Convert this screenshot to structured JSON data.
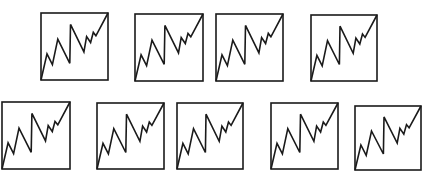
{
  "figure": {
    "stroke_color": "#1a1a1a",
    "background_color": "#ffffff",
    "stroke_width": 1.6,
    "zigzag_points_normalized": [
      [
        0,
        100
      ],
      [
        9,
        61
      ],
      [
        17,
        77
      ],
      [
        25,
        39
      ],
      [
        43,
        75
      ],
      [
        44,
        17
      ],
      [
        64,
        58
      ],
      [
        68,
        35
      ],
      [
        74,
        44
      ],
      [
        78,
        29
      ],
      [
        82,
        34
      ],
      [
        100,
        0
      ]
    ],
    "rows": [
      {
        "name": "top-row",
        "panels": [
          {
            "x": 41,
            "y": 13,
            "w": 67,
            "h": 67
          },
          {
            "x": 135,
            "y": 14,
            "w": 68,
            "h": 67
          },
          {
            "x": 216,
            "y": 14,
            "w": 67,
            "h": 67
          },
          {
            "x": 311,
            "y": 15,
            "w": 66,
            "h": 66
          }
        ]
      },
      {
        "name": "bottom-row",
        "panels": [
          {
            "x": 2,
            "y": 102,
            "w": 68,
            "h": 67
          },
          {
            "x": 97,
            "y": 103,
            "w": 67,
            "h": 66
          },
          {
            "x": 177,
            "y": 103,
            "w": 66,
            "h": 66
          },
          {
            "x": 271,
            "y": 103,
            "w": 67,
            "h": 66
          },
          {
            "x": 355,
            "y": 106,
            "w": 66,
            "h": 64
          }
        ]
      }
    ]
  }
}
